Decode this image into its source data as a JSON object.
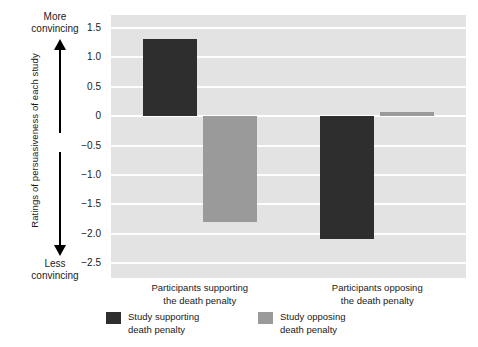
{
  "chart_data": {
    "type": "bar",
    "title": "",
    "subtitle": "",
    "xlabel": "",
    "ylabel": "Ratings of persuasiveness of each study",
    "ylim": [
      -2.75,
      1.72
    ],
    "yticks": [
      "1.5",
      "1.0",
      "0.5",
      "0",
      "−0.5",
      "−1.0",
      "−1.5",
      "−2.0",
      "−2.5"
    ],
    "ytick_values": [
      1.5,
      1.0,
      0.5,
      0,
      -0.5,
      -1.0,
      -1.5,
      -2.0,
      -2.5
    ],
    "grid": true,
    "legend_position": "bottom",
    "categories": [
      "Participants supporting\nthe death penalty",
      "Participants opposing\nthe death penalty"
    ],
    "series": [
      {
        "name": "Study supporting\ndeath penalty",
        "color": "#2e2e2e",
        "values": [
          1.32,
          -2.08
        ]
      },
      {
        "name": "Study opposing\ndeath penalty",
        "color": "#9a9a9a",
        "values": [
          -1.8,
          0.07
        ]
      }
    ],
    "annotations": [
      {
        "name": "more-convincing",
        "text": "More\nconvincing",
        "position": "top-left",
        "arrow": "up"
      },
      {
        "name": "less-convincing",
        "text": "Less\nconvincing",
        "position": "bottom-left",
        "arrow": "down"
      }
    ],
    "colors": {
      "plot_background": "#e3e3e3",
      "gridline": "#fdfdfd",
      "zero_line": "#ffffff",
      "text": "#1a1a1a",
      "page_background": "#ffffff"
    }
  }
}
